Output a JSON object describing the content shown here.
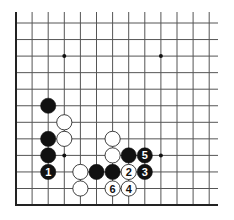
{
  "diagram": {
    "type": "go-board-fragment",
    "colors": {
      "background": "#ffffff",
      "line": "#555555",
      "edge": "#222222",
      "black": "#111111",
      "white": "#ffffff",
      "star": "#111111"
    },
    "grid": {
      "x0": 16,
      "y0": 23,
      "dx": 16.1,
      "dy": 16.55,
      "cols": 13,
      "rows": 12,
      "open_top_y": 12,
      "open_right_x": 218
    },
    "edges": [
      "left",
      "bottom"
    ],
    "star_points": [
      [
        3,
        2
      ],
      [
        9,
        2
      ],
      [
        3,
        8
      ],
      [
        9,
        8
      ]
    ],
    "stones": [
      {
        "color": "black",
        "col": 2,
        "row": 5,
        "label": ""
      },
      {
        "color": "white",
        "col": 3,
        "row": 6,
        "label": ""
      },
      {
        "color": "black",
        "col": 2,
        "row": 7,
        "label": ""
      },
      {
        "color": "white",
        "col": 3,
        "row": 7,
        "label": ""
      },
      {
        "color": "black",
        "col": 2,
        "row": 8,
        "label": ""
      },
      {
        "color": "black",
        "col": 2,
        "row": 9,
        "label": "1"
      },
      {
        "color": "white",
        "col": 4,
        "row": 9,
        "label": ""
      },
      {
        "color": "white",
        "col": 4,
        "row": 10,
        "label": ""
      },
      {
        "color": "black",
        "col": 5,
        "row": 9,
        "label": ""
      },
      {
        "color": "black",
        "col": 6,
        "row": 9,
        "label": ""
      },
      {
        "color": "white",
        "col": 6,
        "row": 7,
        "label": ""
      },
      {
        "color": "white",
        "col": 6,
        "row": 8,
        "label": ""
      },
      {
        "color": "black",
        "col": 7,
        "row": 8,
        "label": ""
      },
      {
        "color": "black",
        "col": 8,
        "row": 8,
        "label": "5"
      },
      {
        "color": "white",
        "col": 7,
        "row": 9,
        "label": "2"
      },
      {
        "color": "black",
        "col": 8,
        "row": 9,
        "label": "3"
      },
      {
        "color": "white",
        "col": 6,
        "row": 10,
        "label": "6"
      },
      {
        "color": "white",
        "col": 7,
        "row": 10,
        "label": "4"
      }
    ]
  }
}
